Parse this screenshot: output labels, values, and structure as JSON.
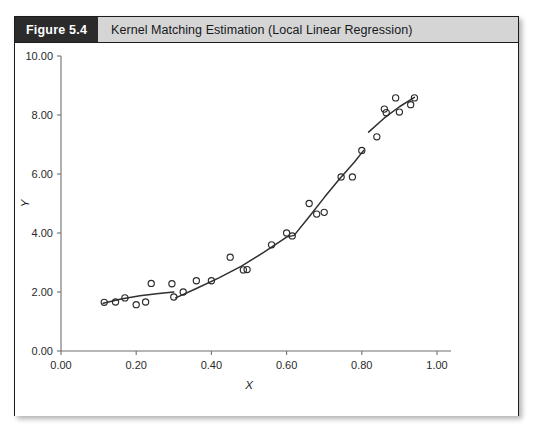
{
  "figure": {
    "badge": "Figure 5.4",
    "title": "Kernel Matching Estimation (Local Linear Regression)"
  },
  "chart_data": {
    "type": "scatter",
    "title": "Kernel Matching Estimation (Local Linear Regression)",
    "xlabel": "X",
    "ylabel": "Y",
    "xlim": [
      0.0,
      1.0
    ],
    "ylim": [
      0.0,
      10.0
    ],
    "grid": false,
    "legend": null,
    "xticks": [
      0.0,
      0.2,
      0.4,
      0.6,
      0.8,
      1.0
    ],
    "xtick_labels": [
      "0.00",
      "0.20",
      "0.40",
      "0.60",
      "0.80",
      "1.00"
    ],
    "yticks": [
      0.0,
      2.0,
      4.0,
      6.0,
      8.0,
      10.0
    ],
    "ytick_labels": [
      "0.00",
      "2.00",
      "4.00",
      "6.00",
      "8.00",
      "10.00"
    ],
    "marker": "open-circle",
    "series": [
      {
        "name": "Observed data",
        "type": "scatter",
        "x": [
          0.115,
          0.145,
          0.17,
          0.2,
          0.225,
          0.24,
          0.295,
          0.3,
          0.325,
          0.36,
          0.4,
          0.45,
          0.485,
          0.495,
          0.56,
          0.6,
          0.615,
          0.66,
          0.68,
          0.7,
          0.745,
          0.775,
          0.8,
          0.84,
          0.86,
          0.865,
          0.89,
          0.9,
          0.93,
          0.94
        ],
        "y": [
          1.65,
          1.66,
          1.8,
          1.57,
          1.66,
          2.29,
          2.28,
          1.83,
          2.0,
          2.38,
          2.38,
          3.18,
          2.75,
          2.76,
          3.6,
          4.0,
          3.9,
          5.0,
          4.64,
          4.7,
          5.9,
          5.9,
          6.8,
          7.26,
          8.2,
          8.08,
          8.58,
          8.1,
          8.35,
          8.58
        ]
      },
      {
        "name": "Local linear regression fit (segment 1)",
        "type": "line",
        "x": [
          0.112,
          0.16,
          0.21,
          0.26,
          0.3
        ],
        "y": [
          1.62,
          1.76,
          1.87,
          1.95,
          2.0
        ]
      },
      {
        "name": "Local linear regression fit (segment 2)",
        "type": "line",
        "x": [
          0.305,
          0.36,
          0.42,
          0.48,
          0.54,
          0.6,
          0.62,
          0.66,
          0.7,
          0.74,
          0.78,
          0.805
        ],
        "y": [
          1.8,
          2.12,
          2.48,
          2.88,
          3.35,
          3.86,
          3.92,
          4.55,
          5.2,
          5.82,
          6.4,
          6.8
        ]
      },
      {
        "name": "Local linear regression fit (segment 3)",
        "type": "line",
        "x": [
          0.818,
          0.86,
          0.9,
          0.94
        ],
        "y": [
          7.42,
          7.9,
          8.28,
          8.6
        ]
      }
    ]
  }
}
